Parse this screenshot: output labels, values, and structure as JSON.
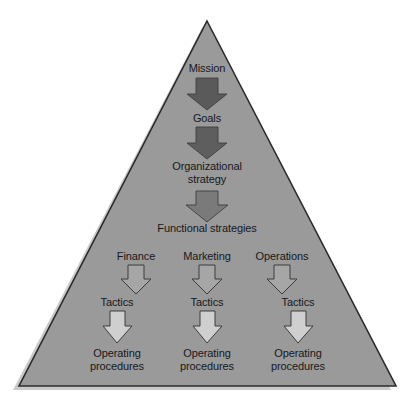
{
  "diagram": {
    "shape": "triangle",
    "colors": {
      "triangle_fill": "#9a9a9a",
      "triangle_stroke": "#2b2b2b",
      "shadow": "#c9c9c9",
      "text": "#17181a",
      "page_background": "#ffffff",
      "arrow_level_1": "#5a5a5a",
      "arrow_level_2": "#5e5e5e",
      "arrow_level_3": "#7a7a7a",
      "arrow_level_4": "#a6a6a6",
      "arrow_level_5": "#cfcfcf",
      "arrow_stroke": "#3c3c3c"
    },
    "levels": [
      {
        "id": "mission",
        "label": "Mission"
      },
      {
        "id": "goals",
        "label": "Goals"
      },
      {
        "id": "organizational-strategy",
        "label": "Organizational\nstrategy"
      },
      {
        "id": "functional-strategies",
        "label": "Functional strategies"
      }
    ],
    "columns": [
      {
        "id": "finance",
        "heading": "Finance",
        "tactics": "Tactics",
        "operating": "Operating\nprocedures"
      },
      {
        "id": "marketing",
        "heading": "Marketing",
        "tactics": "Tactics",
        "operating": "Operating\nprocedures"
      },
      {
        "id": "operations",
        "heading": "Operations",
        "tactics": "Tactics",
        "operating": "Operating\nprocedures"
      }
    ],
    "arrows": [
      {
        "id": "mission-to-goals",
        "direction": "down",
        "style": "filled-dark"
      },
      {
        "id": "goals-to-organizational-strategy",
        "direction": "down",
        "style": "filled-dark"
      },
      {
        "id": "organizational-to-functional-strategies",
        "direction": "down",
        "style": "filled-medium"
      },
      {
        "id": "finance-to-tactics",
        "direction": "down",
        "style": "outlined-light"
      },
      {
        "id": "marketing-to-tactics",
        "direction": "down",
        "style": "outlined-light"
      },
      {
        "id": "operations-to-tactics",
        "direction": "down",
        "style": "outlined-light"
      },
      {
        "id": "finance-tactics-to-operating-procedures",
        "direction": "down",
        "style": "outlined-lightest"
      },
      {
        "id": "marketing-tactics-to-operating-procedures",
        "direction": "down",
        "style": "outlined-lightest"
      },
      {
        "id": "operations-tactics-to-operating-procedures",
        "direction": "down",
        "style": "outlined-lightest"
      }
    ]
  }
}
